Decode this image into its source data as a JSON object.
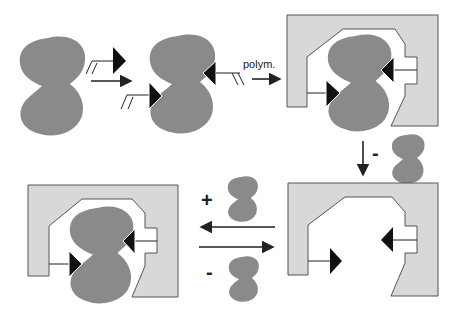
{
  "diagram": {
    "colors": {
      "template": "#8a8a8a",
      "polymer": "#d8d8d8",
      "polymer_outline": "#555555",
      "functional_group": "#111111",
      "arrow": "#222222"
    },
    "steps": [
      {
        "id": "template",
        "label": "Template molecule"
      },
      {
        "id": "prearranged",
        "label": "Template with functional monomers"
      },
      {
        "id": "imprinted-polymer",
        "label": "Polymer with bound template"
      },
      {
        "id": "empty-cavity",
        "label": "Polymer with empty cavity"
      },
      {
        "id": "rebound",
        "label": "Polymer with rebound template"
      }
    ],
    "labels": {
      "polymerization": "polym.",
      "removal_sign": "-",
      "rebinding_plus": "+",
      "release_minus": "-"
    }
  }
}
